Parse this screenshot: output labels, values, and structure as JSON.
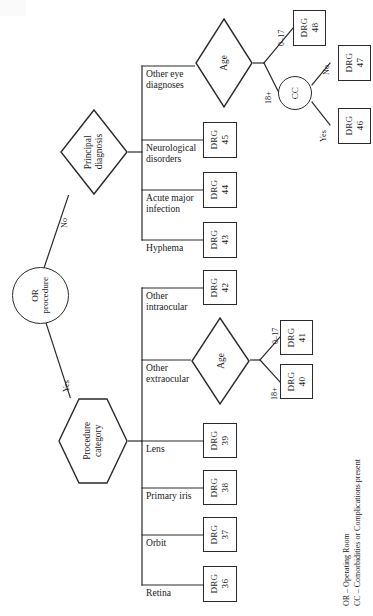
{
  "figure": {
    "orientation": "rotated-90"
  },
  "root": {
    "label_line1": "OR",
    "label_line2": "procedure",
    "shape": "circle"
  },
  "root_branches": [
    {
      "label": "No"
    },
    {
      "label": "Yes"
    }
  ],
  "decisions": {
    "principal_diagnosis": {
      "line1": "Principal",
      "line2": "diagnosis",
      "shape": "diamond"
    },
    "procedure_category": {
      "line1": "Procedure",
      "line2": "category",
      "shape": "hexagon"
    },
    "age_top": {
      "label": "Age",
      "shape": "diamond"
    },
    "age_bottom": {
      "label": "Age",
      "shape": "diamond"
    },
    "cc": {
      "label": "CC",
      "shape": "circle"
    }
  },
  "diagnosis_branches": [
    {
      "line1": "Other eye",
      "line2": "diagnoses"
    },
    {
      "line1": "Neurological",
      "line2": "disorders"
    },
    {
      "line1": "Acute major",
      "line2": "infection"
    },
    {
      "line1": "Hyphema",
      "line2": ""
    }
  ],
  "procedure_branches": [
    {
      "line1": "Other",
      "line2": "intraocular"
    },
    {
      "line1": "Other",
      "line2": "extraocular"
    },
    {
      "line1": "Lens",
      "line2": ""
    },
    {
      "line1": "Primary iris",
      "line2": ""
    },
    {
      "line1": "Orbit",
      "line2": ""
    },
    {
      "line1": "Retina",
      "line2": ""
    }
  ],
  "age_labels": {
    "young": "0–17",
    "adult": "18+"
  },
  "cc_labels": {
    "no": "No",
    "yes": "Yes"
  },
  "drg": {
    "word": "DRG",
    "n48": "48",
    "n47": "47",
    "n46": "46",
    "n45": "45",
    "n44": "44",
    "n43": "43",
    "n42": "42",
    "n41": "41",
    "n40": "40",
    "n39": "39",
    "n38": "38",
    "n37": "37",
    "n36": "36"
  },
  "legend": {
    "line1": "OR – Operating Room",
    "line2": "CC – Comorbidities or Complications present"
  },
  "colors": {
    "stroke": "#2a2a2a",
    "text": "#1a1a1a",
    "background": "#ffffff"
  }
}
